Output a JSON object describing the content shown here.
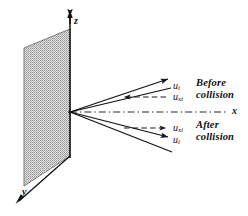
{
  "figure": {
    "axes": [
      {
        "id": "z",
        "label": "z"
      },
      {
        "id": "x",
        "label": "x"
      },
      {
        "id": "y",
        "label": "y"
      }
    ],
    "plane": {
      "name": "wall-plane",
      "fill_color": "#b4b4b4",
      "edge_color": "#555555"
    },
    "vectors": [
      {
        "id": "u-before",
        "label": "u",
        "subscript": "i",
        "style": "solid",
        "phase": "before"
      },
      {
        "id": "ux-before",
        "label": "u",
        "subscript": "xi",
        "style": "dashed",
        "phase": "before"
      },
      {
        "id": "ux-after",
        "label": "u",
        "subscript": "xi",
        "style": "dashed",
        "phase": "after"
      },
      {
        "id": "u-after",
        "label": "u",
        "subscript": "i",
        "style": "solid",
        "phase": "after"
      }
    ],
    "annotations": [
      {
        "id": "before-collision",
        "line1": "Before",
        "line2": "collision"
      },
      {
        "id": "after-collision",
        "line1": "After",
        "line2": "collision"
      }
    ],
    "colors": {
      "ink": "#111111",
      "dashed": "#3a3a3a"
    }
  }
}
